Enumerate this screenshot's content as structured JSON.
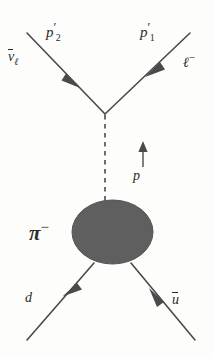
{
  "diagram": {
    "type": "feynman-diagram",
    "colors": {
      "line": "#4a4a4a",
      "text": "#2b2b2b",
      "blob_fill": "#5f5f5f",
      "background": "#fdfdfc"
    },
    "labels": {
      "momentum_out_left": {
        "base": "p",
        "prime": "′",
        "sub": "2"
      },
      "momentum_out_right": {
        "base": "p",
        "prime": "′",
        "sub": "1"
      },
      "antineutrino": {
        "base": "ν",
        "sub": "ℓ",
        "overline": true
      },
      "lepton": {
        "base": "ℓ",
        "sup": "−"
      },
      "propagator_momentum": {
        "base": "p"
      },
      "pion": {
        "base": "π",
        "sup": "−"
      },
      "down_quark": {
        "base": "d"
      },
      "up_antiquark": {
        "base": "u",
        "overline": true
      }
    },
    "elements": {
      "blob_name": "pion-blob",
      "propagator_name": "w-boson-propagator",
      "vertex_name": "weak-vertex"
    }
  }
}
